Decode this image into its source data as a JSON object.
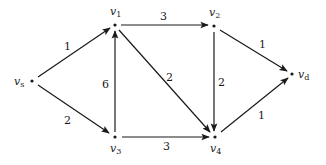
{
  "graph": {
    "nodes": [
      {
        "id": "vs",
        "label": "v",
        "sub": "s",
        "x": 32,
        "y": 81
      },
      {
        "id": "v1",
        "label": "v",
        "sub": "1",
        "x": 115,
        "y": 25
      },
      {
        "id": "v2",
        "label": "v",
        "sub": "2",
        "x": 214,
        "y": 26
      },
      {
        "id": "vd",
        "label": "v",
        "sub": "d",
        "x": 292,
        "y": 74
      },
      {
        "id": "v3",
        "label": "v",
        "sub": "3",
        "x": 115,
        "y": 137
      },
      {
        "id": "v4",
        "label": "v",
        "sub": "4",
        "x": 215,
        "y": 137
      }
    ],
    "edges": [
      {
        "from": "vs",
        "to": "v1",
        "weight": "1"
      },
      {
        "from": "vs",
        "to": "v3",
        "weight": "2"
      },
      {
        "from": "v3",
        "to": "v1",
        "weight": "6"
      },
      {
        "from": "v1",
        "to": "v2",
        "weight": "3"
      },
      {
        "from": "v1",
        "to": "v4",
        "weight": "2"
      },
      {
        "from": "v2",
        "to": "v4",
        "weight": "2"
      },
      {
        "from": "v2",
        "to": "vd",
        "weight": "1"
      },
      {
        "from": "v3",
        "to": "v4",
        "weight": "3"
      },
      {
        "from": "v4",
        "to": "vd",
        "weight": "1"
      }
    ],
    "edge_color": "#1a1a1a"
  }
}
